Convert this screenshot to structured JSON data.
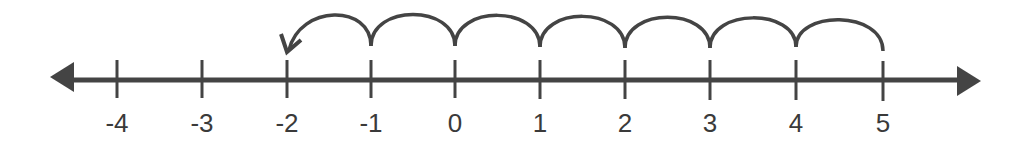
{
  "diagram": {
    "type": "number-line",
    "range": [
      -4,
      5
    ],
    "ticks": [
      {
        "value": -4,
        "label": "-4",
        "x": 117
      },
      {
        "value": -3,
        "label": "-3",
        "x": 202
      },
      {
        "value": -2,
        "label": "-2",
        "x": 287
      },
      {
        "value": -1,
        "label": "-1",
        "x": 371
      },
      {
        "value": 0,
        "label": "0",
        "x": 455
      },
      {
        "value": 1,
        "label": "1",
        "x": 540
      },
      {
        "value": 2,
        "label": "2",
        "x": 625
      },
      {
        "value": 3,
        "label": "3",
        "x": 710
      },
      {
        "value": 4,
        "label": "4",
        "x": 796
      },
      {
        "value": 5,
        "label": "5",
        "x": 883
      }
    ],
    "jumps": {
      "start": 5,
      "end": -2,
      "count": 7,
      "direction": "left"
    },
    "colors": {
      "line": "#444444",
      "text": "#3a3a3a"
    }
  }
}
